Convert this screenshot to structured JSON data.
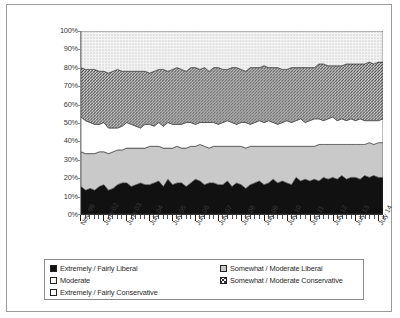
{
  "chart_data": {
    "type": "area",
    "stacked": true,
    "title": "",
    "xlabel": "",
    "ylabel": "",
    "ylim": [
      0,
      100
    ],
    "ytick_labels": [
      "100%",
      "90%",
      "80%",
      "70%",
      "60%",
      "50%",
      "40%",
      "30%",
      "20%",
      "10%",
      "0%"
    ],
    "ytick_values": [
      100,
      90,
      80,
      70,
      60,
      50,
      40,
      30,
      20,
      10,
      0
    ],
    "grid": false,
    "legend_position": "bottom",
    "x_tick_labels": [
      "Nov. 99",
      "June 02",
      "June 03",
      "July 04",
      "July 05",
      "July 06",
      "July 07",
      "July 08",
      "July 09",
      "July 10",
      "July 11",
      "July 12",
      "July 13",
      "July 14"
    ],
    "x_major_tick_index": [
      0,
      5,
      10,
      15,
      20,
      25,
      30,
      35,
      40,
      45,
      50,
      55,
      60,
      65
    ],
    "n_points": 67,
    "series": [
      {
        "name": "Extremely / Fairly Liberal",
        "pattern": "solid-black",
        "color": "#111111",
        "values": [
          15,
          13,
          14,
          13,
          15,
          16,
          13,
          14,
          16,
          17,
          17,
          15,
          16,
          17,
          16,
          16,
          17,
          18,
          15,
          19,
          16,
          17,
          17,
          15,
          17,
          19,
          18,
          16,
          17,
          17,
          16,
          16,
          18,
          15,
          17,
          16,
          14,
          16,
          17,
          18,
          16,
          17,
          19,
          17,
          18,
          17,
          16,
          20,
          18,
          19,
          18,
          19,
          18,
          20,
          19,
          20,
          19,
          21,
          19,
          20,
          20,
          19,
          21,
          20,
          21,
          20,
          20
        ]
      },
      {
        "name": "Somewhat / Moderate Liberal",
        "pattern": "light-grey-solid",
        "color": "#c9c9c9",
        "values": [
          19,
          20,
          19,
          20,
          19,
          18,
          20,
          20,
          19,
          18,
          19,
          21,
          20,
          19,
          20,
          21,
          20,
          19,
          21,
          17,
          20,
          20,
          19,
          21,
          20,
          18,
          20,
          21,
          19,
          20,
          21,
          21,
          19,
          22,
          20,
          21,
          22,
          21,
          20,
          19,
          21,
          20,
          18,
          20,
          19,
          20,
          21,
          17,
          19,
          18,
          19,
          18,
          20,
          18,
          19,
          18,
          19,
          17,
          19,
          18,
          18,
          19,
          17,
          19,
          17,
          19,
          19
        ]
      },
      {
        "name": "Moderate",
        "pattern": "white",
        "color": "#ffffff",
        "values": [
          19,
          18,
          17,
          16,
          15,
          16,
          14,
          13,
          12,
          13,
          14,
          13,
          12,
          11,
          13,
          12,
          11,
          13,
          12,
          14,
          13,
          12,
          13,
          14,
          13,
          12,
          12,
          13,
          14,
          13,
          12,
          13,
          14,
          13,
          12,
          13,
          14,
          12,
          13,
          14,
          13,
          14,
          13,
          12,
          13,
          14,
          13,
          14,
          15,
          13,
          14,
          15,
          14,
          13,
          14,
          15,
          13,
          14,
          13,
          14,
          13,
          14,
          13,
          12,
          13,
          12,
          13
        ]
      },
      {
        "name": "Somewhat / Moderate Conservative",
        "pattern": "dark-cross-hatch",
        "color": "#777777",
        "values": [
          27,
          28,
          29,
          30,
          29,
          28,
          30,
          31,
          32,
          30,
          28,
          29,
          30,
          31,
          29,
          28,
          30,
          29,
          31,
          28,
          30,
          31,
          30,
          28,
          30,
          31,
          29,
          30,
          28,
          30,
          31,
          29,
          28,
          30,
          31,
          29,
          28,
          31,
          30,
          29,
          31,
          29,
          30,
          31,
          29,
          28,
          30,
          29,
          28,
          30,
          29,
          28,
          30,
          31,
          29,
          28,
          30,
          29,
          31,
          30,
          31,
          30,
          31,
          32,
          31,
          32,
          31
        ]
      },
      {
        "name": "Extremely / Fairly Conservative",
        "pattern": "light-dots",
        "color": "#ebebeb",
        "values": [
          20,
          21,
          21,
          21,
          22,
          22,
          23,
          22,
          21,
          22,
          22,
          22,
          22,
          22,
          22,
          23,
          22,
          21,
          21,
          22,
          21,
          20,
          21,
          22,
          20,
          20,
          21,
          20,
          22,
          20,
          20,
          21,
          21,
          20,
          20,
          21,
          22,
          20,
          20,
          20,
          19,
          20,
          20,
          20,
          21,
          21,
          20,
          20,
          20,
          20,
          20,
          20,
          18,
          18,
          19,
          19,
          19,
          19,
          18,
          18,
          18,
          18,
          18,
          17,
          18,
          17,
          17
        ]
      }
    ]
  },
  "legend": {
    "left_items": [
      {
        "label": "Extremely / Fairly Liberal",
        "swatch": "solid"
      },
      {
        "label": "Moderate",
        "swatch": "white"
      },
      {
        "label": "Extremely / Fairly Conservative",
        "swatch": "dots"
      }
    ],
    "right_items": [
      {
        "label": "Somewhat / Moderate Liberal",
        "swatch": "grey"
      },
      {
        "label": "Somewhat / Moderate Conservative",
        "swatch": "cross"
      }
    ]
  }
}
